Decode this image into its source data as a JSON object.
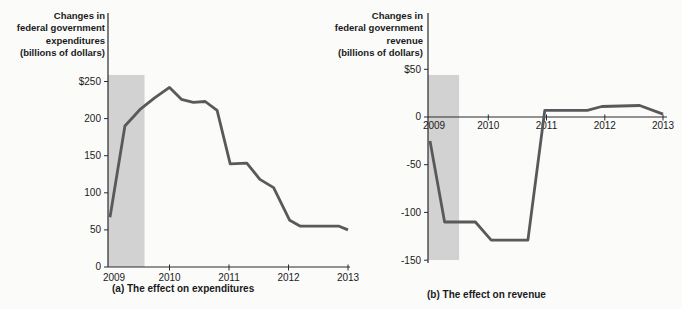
{
  "figure": {
    "background": "#fbfbfa",
    "line_color": "#58595b",
    "band_color": "#d2d2d2",
    "axis_color": "#2a2a2a",
    "text_color": "#1a1a1a"
  },
  "chart_data": [
    {
      "type": "line",
      "title": "Changes in federal government expenditures (billions of dollars)",
      "title_multiline": "Changes in\nfederal government\nexpenditures\n(billions of dollars)",
      "caption": "(a) The effect on expenditures",
      "ylabel": "Changes in federal government expenditures (billions of dollars)",
      "xlim": [
        2009,
        2013
      ],
      "ylim": [
        0,
        250
      ],
      "xticks": [
        2009,
        2010,
        2011,
        2012,
        2013
      ],
      "xtick_labels": [
        "2009",
        "2010",
        "2011",
        "2012",
        "2013"
      ],
      "yticks": [
        0,
        50,
        100,
        150,
        200,
        250
      ],
      "ytick_labels": [
        "0",
        "50",
        "100",
        "150",
        "200",
        "$250"
      ],
      "grid": false,
      "legend": false,
      "shaded_band": {
        "x0": 2009.0,
        "x1": 2009.58
      },
      "series": [
        {
          "name": "change-in-expenditures",
          "x": [
            2009.0,
            2009.25,
            2009.5,
            2009.75,
            2010.0,
            2010.2,
            2010.4,
            2010.6,
            2010.8,
            2011.02,
            2011.3,
            2011.52,
            2011.75,
            2012.02,
            2012.2,
            2012.85,
            2013.0
          ],
          "y": [
            67,
            190,
            212,
            228,
            242,
            226,
            222,
            223,
            211,
            139,
            140,
            118,
            107,
            63,
            55,
            55,
            50
          ]
        }
      ]
    },
    {
      "type": "line",
      "title": "Changes in federal government revenue (billions of dollars)",
      "title_multiline": "Changes in\nfederal government\nrevenue\n(billions of dollars)",
      "caption": "(b) The effect on revenue",
      "ylabel": "Changes in federal government revenue (billions of dollars)",
      "xlim": [
        2009,
        2013
      ],
      "ylim": [
        -150,
        50
      ],
      "xticks": [
        2009,
        2010,
        2011,
        2012,
        2013
      ],
      "xtick_labels": [
        "2009",
        "2010",
        "2011",
        "2012",
        "2013"
      ],
      "yticks": [
        -150,
        -100,
        -50,
        0,
        50
      ],
      "ytick_labels": [
        "-150",
        "-100",
        "-50",
        "0",
        "$50"
      ],
      "grid": false,
      "legend": false,
      "shaded_band": {
        "x0": 2009.0,
        "x1": 2009.5
      },
      "series": [
        {
          "name": "change-in-revenue",
          "x": [
            2009.0,
            2009.25,
            2009.78,
            2010.05,
            2010.68,
            2010.97,
            2011.7,
            2011.95,
            2012.6,
            2013.0
          ],
          "y": [
            -25,
            -110,
            -110,
            -129,
            -129,
            7,
            7,
            11,
            12,
            3
          ]
        }
      ]
    }
  ]
}
